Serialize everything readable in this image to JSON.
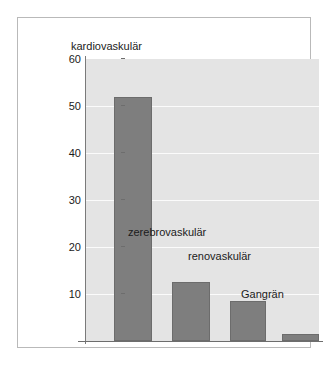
{
  "chart_data": {
    "type": "bar",
    "title": "",
    "subtitle": "",
    "xlabel": "",
    "ylabel": "Häufigkeit (%)",
    "ylim": [
      0,
      60
    ],
    "ytick_labels": [
      "60",
      "50",
      "40",
      "30",
      "20",
      "10"
    ],
    "yticks": [
      60,
      50,
      40,
      30,
      20,
      10
    ],
    "grid": true,
    "legend_position": "none",
    "categories": [
      "kardiovaskulär",
      "zerebrovaskulär",
      "renovaskulär",
      "Gangrän"
    ],
    "values": [
      52,
      12.5,
      8.5,
      1.5
    ],
    "annotations": [
      {
        "text": "kardiovaskulär",
        "value": 52
      },
      {
        "text": "zerebrovaskulär",
        "value": 12.5
      },
      {
        "text": "renovaskulär",
        "value": 8.5
      },
      {
        "text": "Gangrän",
        "value": 1.5
      }
    ],
    "colors": {
      "bar": "#7e7e7e",
      "bar_border": "#6c6c6c",
      "plot_background": "#e4e4e4",
      "gridline": "#fbfbfb",
      "axis": "#6d6d6d",
      "text": "#1b1b1b",
      "frame_border": "#b9b9b9",
      "page_background": "#ffffff"
    }
  }
}
